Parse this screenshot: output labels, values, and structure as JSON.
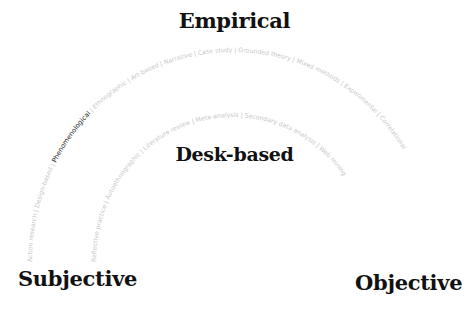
{
  "axes": {
    "top": "Empirical",
    "middle": "Desk-based",
    "left": "Subjective",
    "right": "Objective"
  },
  "outer_arc": {
    "items": [
      {
        "label": "Action research",
        "active": false
      },
      {
        "label": "Design-based",
        "active": false
      },
      {
        "label": "Phenomenological",
        "active": true
      },
      {
        "label": "Ethnographic",
        "active": false
      },
      {
        "label": "Art-based",
        "active": false
      },
      {
        "label": "Narrative",
        "active": false
      },
      {
        "label": "Case study",
        "active": false
      },
      {
        "label": "Grounded theory",
        "active": false
      },
      {
        "label": "Mixed methods",
        "active": false
      },
      {
        "label": "Experimental",
        "active": false
      },
      {
        "label": "Correlational",
        "active": false
      }
    ]
  },
  "inner_arc": {
    "items": [
      {
        "label": "Reflective practice",
        "active": false
      },
      {
        "label": "Autoethnographic",
        "active": false
      },
      {
        "label": "Literature review",
        "active": false
      },
      {
        "label": "Meta-analysis",
        "active": false
      },
      {
        "label": "Secondary data analysis",
        "active": false
      },
      {
        "label": "Web mining",
        "active": false
      }
    ]
  },
  "colors": {
    "active_label": "#222222",
    "inactive_label": "#c8c8c8",
    "axis_label": "#111111"
  }
}
